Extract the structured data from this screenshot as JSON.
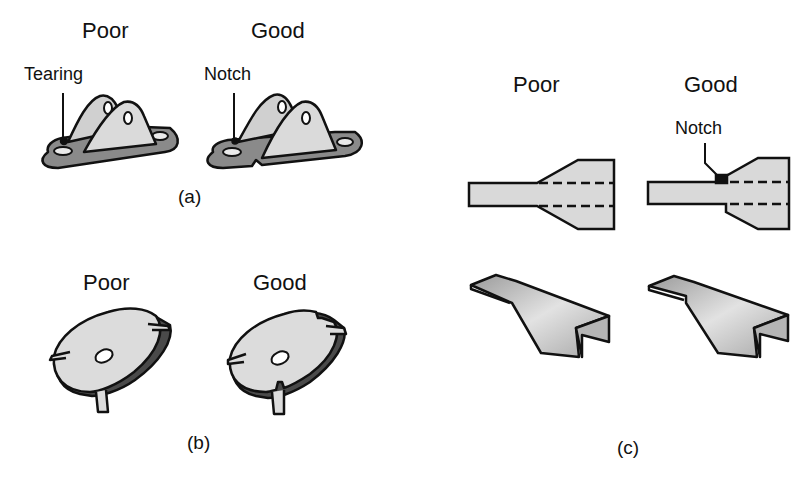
{
  "figure": {
    "panels": [
      {
        "id": "a",
        "caption": "(a)",
        "poor": {
          "heading": "Poor",
          "callout": "Tearing"
        },
        "good": {
          "heading": "Good",
          "callout": "Notch"
        }
      },
      {
        "id": "b",
        "caption": "(b)",
        "poor": {
          "heading": "Poor"
        },
        "good": {
          "heading": "Good"
        }
      },
      {
        "id": "c",
        "caption": "(c)",
        "poor": {
          "heading": "Poor"
        },
        "good": {
          "heading": "Good",
          "callout": "Notch"
        }
      }
    ],
    "colors": {
      "outline": "#111111",
      "part_fill": "#d9d9d9",
      "part_dark": "#8a8a8a",
      "background": "#ffffff"
    }
  }
}
